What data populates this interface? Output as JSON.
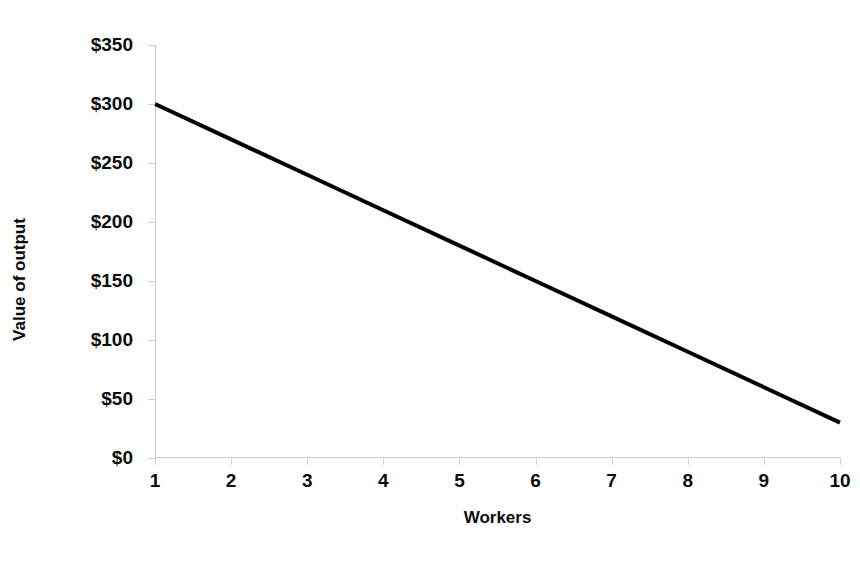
{
  "chart_data": {
    "type": "line",
    "title": "",
    "xlabel": "Workers",
    "ylabel": "Value of output",
    "x": [
      1,
      2,
      3,
      4,
      5,
      6,
      7,
      8,
      9,
      10
    ],
    "categories": [
      "1",
      "2",
      "3",
      "4",
      "5",
      "6",
      "7",
      "8",
      "9",
      "10"
    ],
    "series": [
      {
        "name": "Value of output",
        "values": [
          300,
          270,
          240,
          210,
          180,
          150,
          120,
          90,
          60,
          30
        ],
        "color": "#000000",
        "line_width": 4
      }
    ],
    "xlim": [
      1,
      10
    ],
    "ylim": [
      0,
      350
    ],
    "y_ticks": [
      0,
      50,
      100,
      150,
      200,
      250,
      300,
      350
    ],
    "y_tick_labels": [
      "$0",
      "$50",
      "$100",
      "$150",
      "$200",
      "$250",
      "$300",
      "$350"
    ],
    "x_ticks": [
      1,
      2,
      3,
      4,
      5,
      6,
      7,
      8,
      9,
      10
    ],
    "x_tick_labels": [
      "1",
      "2",
      "3",
      "4",
      "5",
      "6",
      "7",
      "8",
      "9",
      "10"
    ],
    "grid": false,
    "legend": false,
    "legend_position": "none",
    "axis_color": "#c9c9c9",
    "tick_color": "#cfcfcf",
    "background": "#ffffff",
    "text_color": "#0c0c0c"
  }
}
